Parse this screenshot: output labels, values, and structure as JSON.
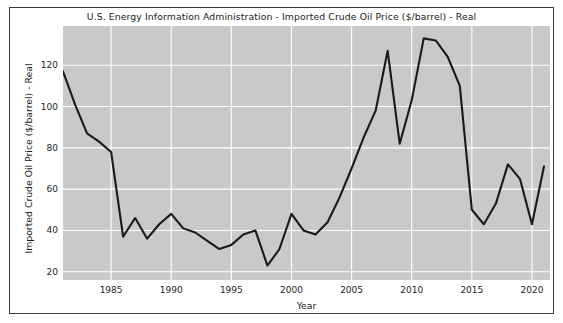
{
  "figure": {
    "title": "U.S. Energy Information Administration - Imported Crude Oil Price ($/barrel) - Real",
    "background_color": "#ffffff",
    "frame_color": "#3a3a3a",
    "plot_background_color": "#c9c9c9",
    "grid_color": "#ffffff",
    "line_color": "#1a1a1a"
  },
  "chart_data": {
    "type": "line",
    "title": "U.S. Energy Information Administration - Imported Crude Oil Price ($/barrel) - Real",
    "xlabel": "Year",
    "ylabel": "Imported Crude Oil Price ($/barrel) - Real",
    "xlim": [
      1981,
      2021.5
    ],
    "ylim": [
      16,
      139
    ],
    "xticks": [
      1985,
      1990,
      1995,
      2000,
      2005,
      2010,
      2015,
      2020
    ],
    "xtick_labels": [
      "1985",
      "1990",
      "1995",
      "2000",
      "2005",
      "2010",
      "2015",
      "2020"
    ],
    "yticks": [
      20,
      40,
      60,
      80,
      100,
      120
    ],
    "ytick_labels": [
      "20",
      "40",
      "60",
      "80",
      "100",
      "120"
    ],
    "grid": true,
    "legend": null,
    "series": [
      {
        "name": "Imported Crude Oil Price ($/barrel) - Real",
        "color": "#1a1a1a",
        "x": [
          1981,
          1982,
          1983,
          1984,
          1985,
          1986,
          1987,
          1988,
          1989,
          1990,
          1991,
          1992,
          1993,
          1994,
          1995,
          1996,
          1997,
          1998,
          1999,
          2000,
          2001,
          2002,
          2003,
          2004,
          2005,
          2006,
          2007,
          2008,
          2009,
          2010,
          2011,
          2012,
          2013,
          2014,
          2015,
          2016,
          2017,
          2018,
          2019,
          2020,
          2021
        ],
        "values": [
          117,
          101,
          87,
          83,
          78,
          37,
          46,
          36,
          43,
          48,
          41,
          39,
          35,
          31,
          33,
          38,
          40,
          23,
          31,
          48,
          40,
          38,
          44,
          56,
          70,
          85,
          98,
          127,
          82,
          103,
          133,
          132,
          124,
          110,
          50,
          43,
          53,
          72,
          65,
          43,
          71
        ]
      }
    ]
  }
}
